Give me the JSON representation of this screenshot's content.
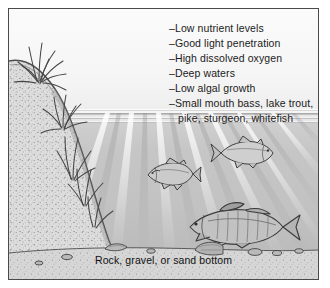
{
  "figure": {
    "background_color": "#ffffff",
    "frame_color": "#4a4a4a"
  },
  "scene": {
    "sky_color": "#f7f7f7",
    "water_color": "#c4c4c4",
    "land_color": "#d8d8d8",
    "bed_color": "#cfcfcf",
    "ink_color": "#3a3a3a",
    "water_surface_label": "water-surface-line",
    "light_rays_label": "light-penetration-rays"
  },
  "characteristics": {
    "items": [
      {
        "dash": "–",
        "text": "Low nutrient levels"
      },
      {
        "dash": "–",
        "text": "Good light penetration"
      },
      {
        "dash": "–",
        "text": "High dissolved oxygen"
      },
      {
        "dash": "–",
        "text": "Deep waters"
      },
      {
        "dash": "–",
        "text": "Low algal growth"
      },
      {
        "dash": "–",
        "text": "Small mouth bass, lake trout,"
      }
    ],
    "continuation": "pike, sturgeon, whitefish"
  },
  "caption": {
    "text": "Rock, gravel, or sand bottom"
  },
  "fish": [
    {
      "name": "fish-midwater-left",
      "species_hint": "lake trout"
    },
    {
      "name": "fish-upper-right",
      "species_hint": "whitefish"
    },
    {
      "name": "fish-lower-large",
      "species_hint": "small mouth bass"
    }
  ],
  "vegetation": [
    {
      "name": "shore-grass-upper"
    },
    {
      "name": "shore-grass-lower"
    },
    {
      "name": "submerged-plants"
    }
  ]
}
